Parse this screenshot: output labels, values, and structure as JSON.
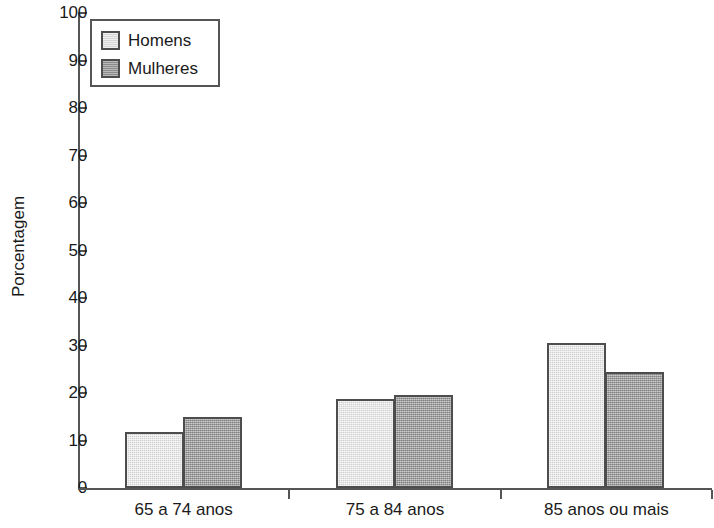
{
  "chart_data": {
    "type": "bar",
    "title": "",
    "subtitle": "",
    "xlabel": "",
    "ylabel": "Porcentagem",
    "ylim": [
      0,
      100
    ],
    "ytick_step": 10,
    "ytick_labels": [
      "0",
      "10",
      "20",
      "30",
      "40",
      "50",
      "60",
      "70",
      "80",
      "90",
      "100"
    ],
    "grid": false,
    "legend_position": "top-left",
    "categories": [
      "65 a 74 anos",
      "75 a 84 anos",
      "85 anos ou mais"
    ],
    "series": [
      {
        "name": "Homens",
        "color": "#dedede",
        "values": [
          11.8,
          18.7,
          30.5
        ]
      },
      {
        "name": "Mulheres",
        "color": "#9b9b9b",
        "values": [
          14.9,
          19.6,
          24.4
        ]
      }
    ]
  },
  "legend": {
    "entries": [
      {
        "label": "Homens",
        "swatch": "light-gray-swatch"
      },
      {
        "label": "Mulheres",
        "swatch": "dark-gray-swatch"
      }
    ]
  },
  "colors": {
    "series_homens": "#dedede",
    "series_mulheres": "#9b9b9b",
    "axis": "#555555",
    "bar_outline": "#4d4d4d",
    "text": "#1a1a1a",
    "background": "#ffffff"
  }
}
